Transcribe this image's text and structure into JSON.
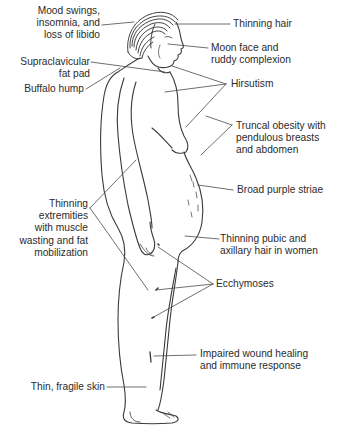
{
  "diagram": {
    "colors": {
      "line": "#3a3a3a",
      "text": "#2b2b2b",
      "background": "#ffffff"
    },
    "labels_left": [
      {
        "id": "mood",
        "lines": [
          "Mood swings,",
          "insomnia, and",
          "loss of libido"
        ]
      },
      {
        "id": "supraclavicular",
        "lines": [
          "Supraclavicular",
          "fat pad"
        ]
      },
      {
        "id": "buffalo",
        "lines": [
          "Buffalo hump"
        ]
      },
      {
        "id": "extremities",
        "lines": [
          "Thinning",
          "extremities",
          "with muscle",
          "wasting and fat",
          "mobilization"
        ]
      },
      {
        "id": "skin",
        "lines": [
          "Thin, fragile skin"
        ]
      }
    ],
    "labels_right": [
      {
        "id": "hair",
        "lines": [
          "Thinning hair"
        ]
      },
      {
        "id": "moon",
        "lines": [
          "Moon face and",
          "ruddy complexion"
        ]
      },
      {
        "id": "hirsutism",
        "lines": [
          "Hirsutism"
        ]
      },
      {
        "id": "truncal",
        "lines": [
          "Truncal obesity with",
          "pendulous breasts",
          "and abdomen"
        ]
      },
      {
        "id": "striae",
        "lines": [
          "Broad purple striae"
        ]
      },
      {
        "id": "pubic",
        "lines": [
          "Thinning pubic and",
          "axillary hair in women"
        ]
      },
      {
        "id": "ecchymoses",
        "lines": [
          "Ecchymoses"
        ]
      },
      {
        "id": "wound",
        "lines": [
          "Impaired wound healing",
          "and immune response"
        ]
      }
    ]
  }
}
